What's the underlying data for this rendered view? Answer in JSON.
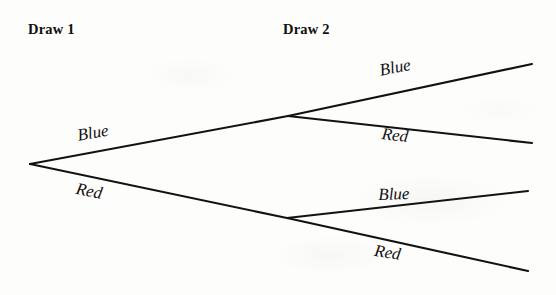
{
  "diagram": {
    "type": "probability-tree",
    "title_visible": false,
    "background_color": "#fdfdfc",
    "line_color": "#121212",
    "text_color": "#101010",
    "stages": [
      {
        "id": "draw-1",
        "label": "Draw 1",
        "x": 28,
        "y": 21
      },
      {
        "id": "draw-2",
        "label": "Draw 2",
        "x": 283,
        "y": 21
      }
    ],
    "nodes": [
      {
        "id": "root",
        "x": 30,
        "y": 164
      },
      {
        "id": "node-blue",
        "x": 288,
        "y": 116
      },
      {
        "id": "node-red",
        "x": 287,
        "y": 218
      },
      {
        "id": "leaf-bb",
        "x": 532,
        "y": 64
      },
      {
        "id": "leaf-br",
        "x": 532,
        "y": 143
      },
      {
        "id": "leaf-rb",
        "x": 528,
        "y": 191
      },
      {
        "id": "leaf-rr",
        "x": 528,
        "y": 271
      }
    ],
    "branches": [
      {
        "id": "branch-1-blue",
        "from": "root",
        "to": "node-blue",
        "label": "Blue",
        "stage": "Draw 1"
      },
      {
        "id": "branch-1-red",
        "from": "root",
        "to": "node-red",
        "label": "Red",
        "stage": "Draw 1"
      },
      {
        "id": "branch-2-blue-blue",
        "from": "node-blue",
        "to": "leaf-bb",
        "label": "Blue",
        "stage": "Draw 2"
      },
      {
        "id": "branch-2-blue-red",
        "from": "node-blue",
        "to": "leaf-br",
        "label": "Red",
        "stage": "Draw 2"
      },
      {
        "id": "branch-2-red-blue",
        "from": "node-red",
        "to": "leaf-rb",
        "label": "Blue",
        "stage": "Draw 2"
      },
      {
        "id": "branch-2-red-red",
        "from": "node-red",
        "to": "leaf-rr",
        "label": "Red",
        "stage": "Draw 2"
      }
    ],
    "labels": [
      {
        "id": "label-d1-blue",
        "text": "Blue",
        "x": 76,
        "y": 126,
        "rotation": -10
      },
      {
        "id": "label-d1-red",
        "text": "Red",
        "x": 78,
        "y": 179,
        "rotation": 11
      },
      {
        "id": "label-d2-bb",
        "text": "Blue",
        "x": 378,
        "y": 61,
        "rotation": -11
      },
      {
        "id": "label-d2-br",
        "text": "Red",
        "x": 383,
        "y": 124,
        "rotation": 7
      },
      {
        "id": "label-d2-rb",
        "text": "Blue",
        "x": 378,
        "y": 185,
        "rotation": -2
      },
      {
        "id": "label-d2-rr",
        "text": "Red",
        "x": 376,
        "y": 241,
        "rotation": 9
      }
    ]
  }
}
